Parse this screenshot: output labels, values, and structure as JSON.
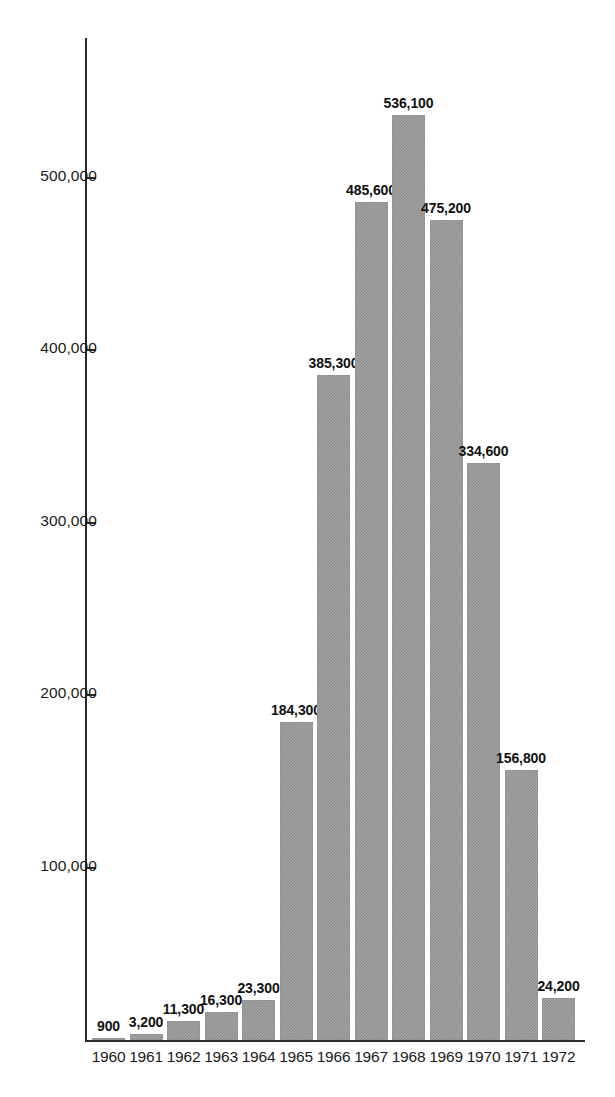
{
  "chart_data": {
    "type": "bar",
    "title": "",
    "xlabel": "",
    "ylabel": "",
    "categories": [
      "1960",
      "1961",
      "1962",
      "1963",
      "1964",
      "1965",
      "1966",
      "1967",
      "1968",
      "1969",
      "1970",
      "1971",
      "1972"
    ],
    "values": [
      900,
      3200,
      11300,
      16300,
      23300,
      184300,
      385300,
      485600,
      536100,
      475200,
      334600,
      156800,
      24200
    ],
    "value_labels": [
      "900",
      "3,200",
      "11,300",
      "16,300",
      "23,300",
      "184,300",
      "385,300",
      "485,600",
      "536,100",
      "475,200",
      "334,600",
      "156,800",
      "24,200"
    ],
    "ylim": [
      0,
      570000
    ],
    "yticks": [
      100000,
      200000,
      300000,
      400000,
      500000
    ],
    "ytick_labels": [
      "100,000",
      "200,000",
      "300,000",
      "400,000",
      "500,000"
    ],
    "grid": false,
    "legend": null,
    "bar_color": "#9a9a9a",
    "axis_color": "#2b2b2b",
    "text_color": "#111111"
  }
}
